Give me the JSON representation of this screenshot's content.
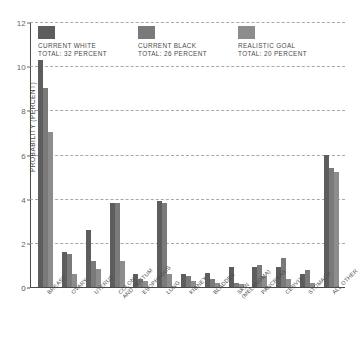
{
  "chart_data": {
    "type": "bar",
    "title": "",
    "xlabel": "",
    "ylabel": "PROBABILITY (PERCENT)",
    "ylim": [
      0,
      12
    ],
    "yticks": [
      0,
      2,
      4,
      6,
      8,
      10,
      12
    ],
    "ytick_labels": [
      "0",
      "2",
      "4",
      "6",
      "8",
      "10",
      "12"
    ],
    "grid": true,
    "legend_position": "top-inside",
    "categories": [
      "BREAST",
      "OVARY",
      "UTERUS",
      "COLON\nAND RECTUM",
      "ESOPHAGUS",
      "LUNG",
      "KIDNEY",
      "BLADDER",
      "SKIN\n(MELANOMA)",
      "PANCREAS",
      "CERVIX",
      "STOMACH",
      "ALL OTHER"
    ],
    "series": [
      {
        "name": "CURRENT WHITE",
        "total_label": "TOTAL: 32 PERCENT",
        "color": "#5d5d5d",
        "values": [
          10.3,
          1.6,
          2.6,
          3.8,
          0.6,
          3.9,
          0.6,
          0.65,
          0.9,
          0.9,
          0.9,
          0.6,
          6.0
        ]
      },
      {
        "name": "CURRENT BLACK",
        "total_label": "TOTAL: 26 PERCENT",
        "color": "#7a7a7a",
        "values": [
          9.0,
          1.5,
          1.2,
          3.8,
          0.35,
          3.8,
          0.5,
          0.35,
          0.2,
          1.0,
          1.3,
          0.75,
          5.4
        ]
      },
      {
        "name": "REALISTIC GOAL",
        "total_label": "TOTAL: 20 PERCENT",
        "color": "#8d8d8d",
        "values": [
          7.0,
          0.6,
          0.8,
          1.2,
          0.25,
          0.6,
          0.25,
          0.2,
          0.15,
          0.5,
          0.35,
          0.2,
          5.2
        ]
      }
    ]
  }
}
